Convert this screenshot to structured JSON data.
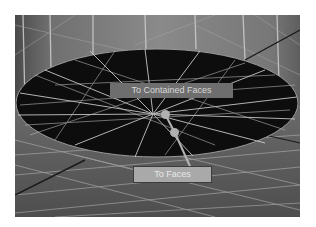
{
  "viewport": {
    "labels": {
      "contained_faces": "To Contained Faces",
      "faces": "To Faces"
    },
    "icons": [
      "gizmo-handle-icon",
      "gizmo-handle-icon"
    ],
    "colors": {
      "mesh_surface": "#7a7a7a",
      "selected_region": "#0d0d0d",
      "wire": "#c8c8c8",
      "edge_line": "#1a1a1a"
    }
  }
}
